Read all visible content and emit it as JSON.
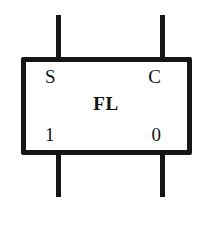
{
  "diagram": {
    "component": {
      "name": "FL",
      "shape": "rectangle",
      "border_color": "#161616",
      "fill_color": "#ffffff",
      "background_color": "#ffffff"
    },
    "labels": {
      "input_set": "S",
      "input_clear": "C",
      "output_one": "1",
      "output_zero": "0",
      "component_name": "FL"
    },
    "pins": [
      {
        "id": "pin-top-left",
        "position": "top-left",
        "connects_to": "S"
      },
      {
        "id": "pin-top-right",
        "position": "top-right",
        "connects_to": "C"
      },
      {
        "id": "pin-bottom-left",
        "position": "bottom-left",
        "connects_to": "1"
      },
      {
        "id": "pin-bottom-right",
        "position": "bottom-right",
        "connects_to": "0"
      }
    ]
  }
}
